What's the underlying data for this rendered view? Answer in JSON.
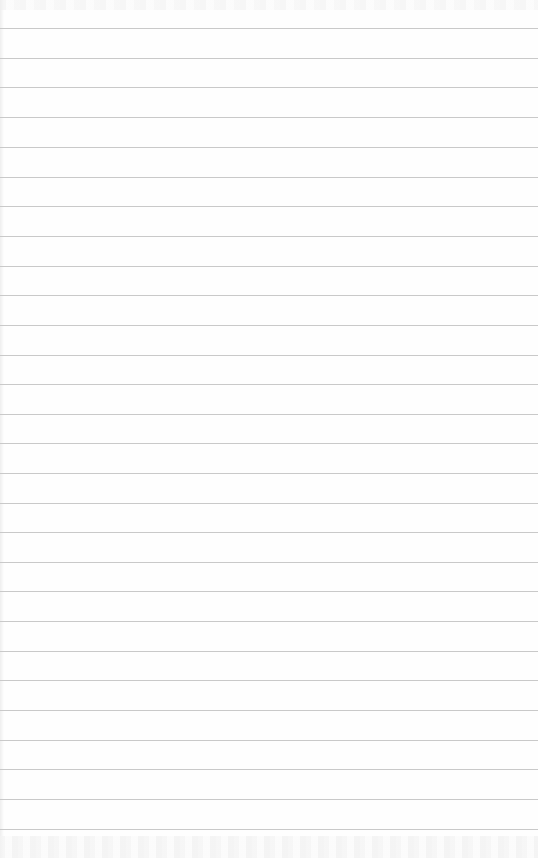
{
  "paper": {
    "kind": "lined-notepad-sheet",
    "background_color": "#fefefe",
    "rule_color": "#c9c9c9",
    "rule_positions_y": [
      28,
      58,
      87,
      117,
      147,
      177,
      206,
      236,
      266,
      295,
      325,
      355,
      384,
      414,
      443,
      473,
      503,
      532,
      562,
      591,
      621,
      651,
      680,
      710,
      740,
      769,
      799,
      829
    ]
  }
}
